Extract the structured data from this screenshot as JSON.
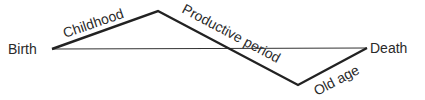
{
  "diagram": {
    "start_label": "Birth",
    "end_label": "Death",
    "segments": [
      {
        "label": "Childhood"
      },
      {
        "label": "Productive period"
      },
      {
        "label": "Old age"
      }
    ]
  }
}
